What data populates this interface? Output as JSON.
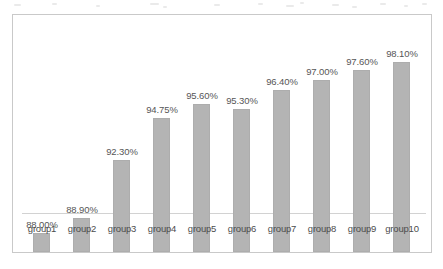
{
  "chart_data": {
    "type": "bar",
    "title": "",
    "subtitle": "",
    "xlabel": "",
    "ylabel": "",
    "categories": [
      "group1",
      "group2",
      "group3",
      "group4",
      "group5",
      "group6",
      "group7",
      "group8",
      "group9",
      "group10"
    ],
    "values": [
      88.0,
      88.9,
      92.3,
      94.75,
      95.6,
      95.3,
      96.4,
      97.0,
      97.6,
      98.1
    ],
    "value_labels": [
      "88.00%",
      "88.90%",
      "92.30%",
      "94.75%",
      "95.60%",
      "95.30%",
      "96.40%",
      "97.00%",
      "97.60%",
      "98.10%"
    ],
    "series": [
      {
        "name": "",
        "values": [
          88.0,
          88.9,
          92.3,
          94.75,
          95.6,
          95.3,
          96.4,
          97.0,
          97.6,
          98.1
        ]
      }
    ],
    "ylim": [
      86.9,
      98.6
    ],
    "unit": "%",
    "grid": false,
    "legend": false,
    "legend_position": "none",
    "bar_color": "#b4b4b4",
    "label_color": "#565656",
    "axis_color": "#d2d2d2",
    "plot_border_color": "#c9c9c9",
    "background_color": "#ffffff",
    "data_labels_shown": true,
    "y_axis_shown": false,
    "baseline_suppressed": true
  }
}
